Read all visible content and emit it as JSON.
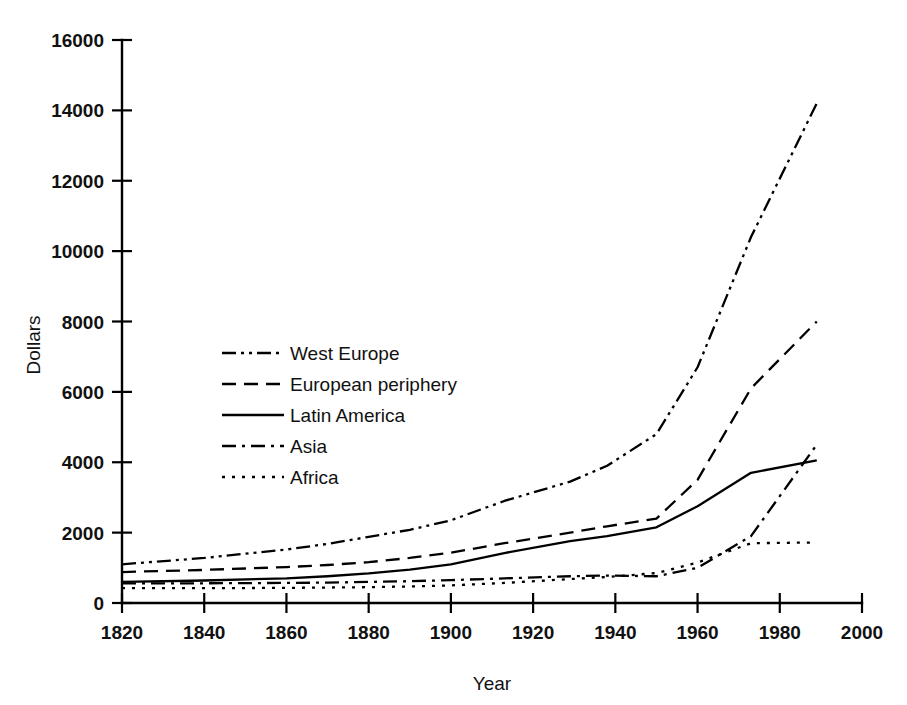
{
  "chart_data": {
    "type": "line",
    "title": "",
    "xlabel": "Year",
    "ylabel": "Dollars",
    "xlim": [
      1820,
      2000
    ],
    "ylim": [
      0,
      16000
    ],
    "xticks": [
      1820,
      1840,
      1860,
      1880,
      1900,
      1920,
      1940,
      1960,
      1980,
      2000
    ],
    "yticks": [
      0,
      2000,
      4000,
      6000,
      8000,
      10000,
      12000,
      14000,
      16000
    ],
    "grid": false,
    "legend_position": "center-left inside plot",
    "series": [
      {
        "name": "West Europe",
        "line_style": "dash-dot-dot",
        "x": [
          1820,
          1840,
          1860,
          1870,
          1880,
          1890,
          1900,
          1913,
          1929,
          1938,
          1950,
          1960,
          1973,
          1989
        ],
        "values": [
          1100,
          1280,
          1520,
          1680,
          1880,
          2080,
          2350,
          2900,
          3450,
          3900,
          4800,
          6700,
          10400,
          14200
        ]
      },
      {
        "name": "European periphery",
        "line_style": "dashed",
        "x": [
          1820,
          1840,
          1860,
          1870,
          1880,
          1890,
          1900,
          1913,
          1929,
          1938,
          1950,
          1960,
          1973,
          1989
        ],
        "values": [
          880,
          940,
          1020,
          1080,
          1160,
          1280,
          1430,
          1700,
          2000,
          2180,
          2400,
          3500,
          6100,
          8000
        ]
      },
      {
        "name": "Latin America",
        "line_style": "solid",
        "x": [
          1820,
          1840,
          1860,
          1870,
          1880,
          1890,
          1900,
          1913,
          1929,
          1938,
          1950,
          1960,
          1973,
          1989
        ],
        "values": [
          600,
          640,
          700,
          760,
          840,
          950,
          1100,
          1420,
          1760,
          1900,
          2150,
          2750,
          3700,
          4050
        ]
      },
      {
        "name": "Asia",
        "line_style": "dash-dot",
        "x": [
          1820,
          1840,
          1860,
          1870,
          1880,
          1890,
          1900,
          1913,
          1929,
          1938,
          1950,
          1960,
          1973,
          1989
        ],
        "values": [
          560,
          560,
          570,
          580,
          600,
          620,
          650,
          700,
          760,
          780,
          760,
          1000,
          1900,
          4500
        ]
      },
      {
        "name": "Africa",
        "line_style": "dotted",
        "x": [
          1820,
          1840,
          1860,
          1870,
          1880,
          1890,
          1900,
          1913,
          1929,
          1938,
          1950,
          1960,
          1973,
          1989
        ],
        "values": [
          420,
          420,
          430,
          440,
          450,
          470,
          500,
          570,
          680,
          740,
          850,
          1150,
          1700,
          1720
        ]
      }
    ]
  },
  "axes": {
    "y_title": "Dollars",
    "x_title": "Year",
    "y_tick_labels": [
      "0",
      "2000",
      "4000",
      "6000",
      "8000",
      "10000",
      "12000",
      "14000",
      "16000"
    ],
    "x_tick_labels": [
      "1820",
      "1840",
      "1860",
      "1880",
      "1900",
      "1920",
      "1940",
      "1960",
      "1980",
      "2000"
    ]
  },
  "legend": {
    "items": [
      {
        "label": "West Europe",
        "style": "dash-dot-dot"
      },
      {
        "label": "European periphery",
        "style": "dashed"
      },
      {
        "label": "Latin America",
        "style": "solid"
      },
      {
        "label": "Asia",
        "style": "dash-dot"
      },
      {
        "label": "Africa",
        "style": "dotted"
      }
    ]
  },
  "colors": {
    "ink": "#000000",
    "background": "#ffffff"
  }
}
